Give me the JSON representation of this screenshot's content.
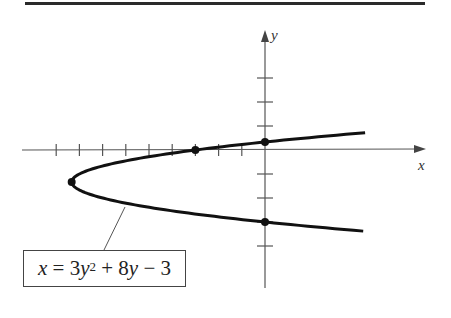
{
  "chart_data": {
    "type": "line",
    "title": "",
    "xlabel": "x",
    "ylabel": "y",
    "equation": {
      "lhs": "x",
      "rhs_parts": [
        "3",
        "y",
        "2",
        " + 8",
        "y",
        " − 3"
      ],
      "text": "x = 3y² + 8y − 3"
    },
    "xlim": [
      -10.5,
      7
    ],
    "ylim": [
      -5,
      5
    ],
    "x_ticks": [
      -9,
      -8,
      -7,
      -6,
      -5,
      -4,
      -3,
      -2,
      -1
    ],
    "y_ticks": [
      -4,
      -3,
      -2,
      -1,
      1,
      2,
      3
    ],
    "curve": {
      "name": "x = 3y^2 + 8y - 3",
      "parametric_in": "y",
      "coefficients": {
        "a": 3,
        "b": 8,
        "c": -3
      },
      "y_range": [
        -3.38,
        0.72
      ]
    },
    "marked_points": [
      {
        "label": "vertex",
        "x": -8.333,
        "y": -1.333
      },
      {
        "label": "x-intercept",
        "x": -3,
        "y": 0
      },
      {
        "label": "y-intercept-upper",
        "x": 0,
        "y": 0.333
      },
      {
        "label": "y-intercept-lower",
        "x": 0,
        "y": -3
      }
    ],
    "grid": false
  }
}
